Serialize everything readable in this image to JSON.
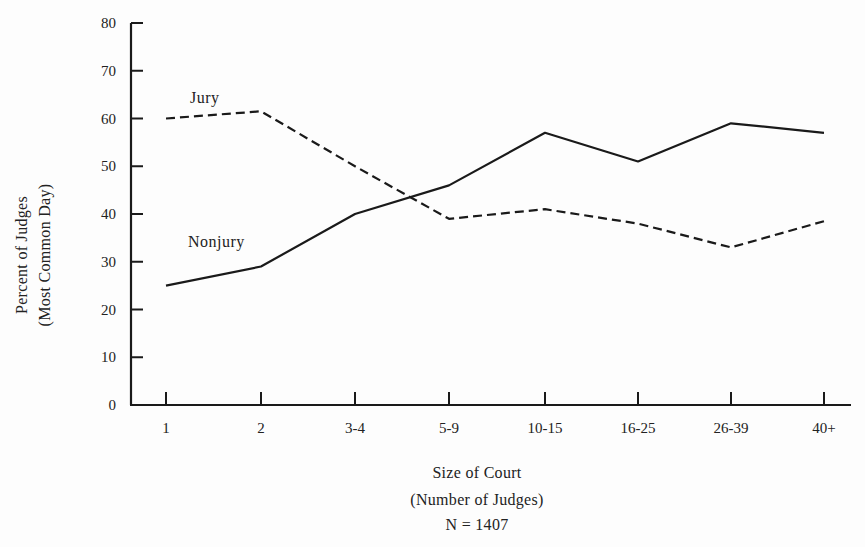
{
  "chart_data": {
    "type": "line",
    "title": "",
    "xlabel": "Size of Court",
    "xlabel_sub": "(Number of Judges)",
    "note": "N = 1407",
    "ylabel": "Percent of Judges",
    "ylabel_sub": "(Most Common Day)",
    "ylim": [
      0,
      80
    ],
    "yticks": [
      0,
      10,
      20,
      30,
      40,
      50,
      60,
      70,
      80
    ],
    "categories": [
      "1",
      "2",
      "3-4",
      "5-9",
      "10-15",
      "16-25",
      "26-39",
      "40+"
    ],
    "grid": false,
    "legend": "inline labels",
    "series": [
      {
        "name": "Jury",
        "style": "dashed",
        "values": [
          60,
          61.5,
          50,
          39,
          41,
          38,
          33,
          38.5
        ]
      },
      {
        "name": "Nonjury",
        "style": "solid",
        "values": [
          25,
          29,
          40,
          46,
          57,
          51,
          59,
          57
        ]
      }
    ]
  },
  "labels": {
    "jury": "Jury",
    "nonjury": "Nonjury",
    "xlabel": "Size of Court",
    "xlabel_sub": "(Number of Judges)",
    "note": "N = 1407",
    "ylabel": "Percent of Judges",
    "ylabel_sub": "(Most Common Day)"
  },
  "colors": {
    "line": "#1a1a1a",
    "background": "#fdfdfd"
  }
}
